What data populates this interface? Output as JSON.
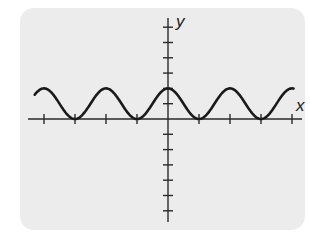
{
  "chart_data": {
    "type": "line",
    "title": "",
    "xlabel": "x",
    "ylabel": "y",
    "function": "y = 1 + cos(πx)",
    "x_tick_count_each_side": 4,
    "y_ticks_above": 6,
    "y_ticks_below": 6,
    "xlim": [
      -4.4,
      4.2
    ],
    "ylim": [
      -6.6,
      6.4
    ],
    "grid": false,
    "legend": null,
    "series": [
      {
        "name": "curve",
        "x": [
          -4.3,
          -4,
          -3.5,
          -3,
          -2.5,
          -2,
          -1.5,
          -1,
          -0.5,
          0,
          0.5,
          1,
          1.5,
          2,
          2.5,
          3,
          3.5,
          4
        ],
        "values": [
          1.59,
          2,
          1,
          0,
          1,
          2,
          1,
          0,
          1,
          2,
          1,
          0,
          1,
          2,
          1,
          0,
          1,
          2
        ]
      }
    ],
    "colors": {
      "background": "#ececec",
      "curve": "#1a1a1a",
      "axis": "#2a2a2a"
    }
  },
  "labels": {
    "x": "x",
    "y": "y"
  }
}
